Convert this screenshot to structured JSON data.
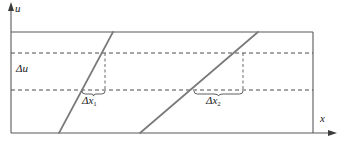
{
  "figure": {
    "type": "diagram",
    "axes": {
      "y_label": "u",
      "x_label": "x",
      "y_axis_x": 11,
      "x_axis_y": 133
    },
    "frame": {
      "left": 11,
      "right": 313,
      "top": 32,
      "bottom": 133,
      "color": "#595959"
    },
    "band": {
      "label": "Δu",
      "upper_y": 53,
      "lower_y": 90,
      "color": "#4d4d4d"
    },
    "lines": [
      {
        "name": "steep-line",
        "x_bottom": 59,
        "y_bottom": 133,
        "x_top": 113,
        "y_top": 32,
        "color": "#7a7a7a"
      },
      {
        "name": "shallow-line",
        "x_bottom": 140,
        "y_bottom": 133,
        "x_top": 258,
        "y_top": 32,
        "color": "#7a7a7a"
      }
    ],
    "intervals": [
      {
        "name": "delta-x-1",
        "label": "Δx",
        "subscript": "1",
        "brace_left": 82,
        "brace_right": 105,
        "brace_y": 93,
        "drop_x": 105
      },
      {
        "name": "delta-x-2",
        "label": "Δx",
        "subscript": "2",
        "brace_left": 194,
        "brace_right": 243,
        "brace_y": 93,
        "drop_x": 243
      }
    ],
    "colors": {
      "line": "#7a7a7a",
      "frame": "#595959",
      "dash": "#4d4d4d",
      "text": "#1a1a1a",
      "background": "#ffffff"
    }
  }
}
